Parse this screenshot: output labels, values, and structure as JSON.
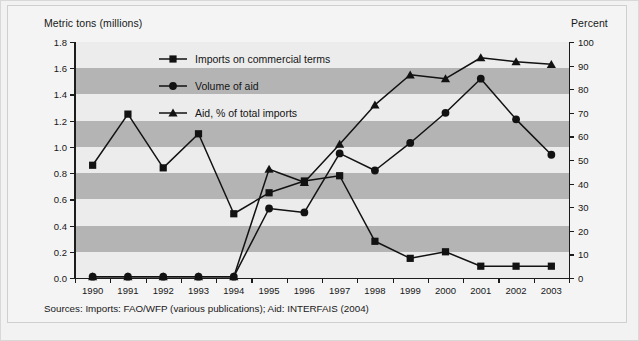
{
  "figure": {
    "y_axis_left_title": "Metric tons (millions)",
    "y_axis_right_title": "Percent",
    "source_note": "Sources: Imports: FAO/WFP (various publications); Aid: INTERFAIS (2004)"
  },
  "legend": {
    "items": [
      {
        "label": "Imports on commercial terms",
        "marker": "square-marker"
      },
      {
        "label": "Volume of aid",
        "marker": "circle-marker"
      },
      {
        "label": "Aid, % of total imports",
        "marker": "triangle-marker"
      }
    ]
  },
  "colors": {
    "band_dark": "#b4b4b4",
    "band_light": "#ececec",
    "ink": "#121212",
    "page_background": "#f2f2f2"
  },
  "chart_data": {
    "type": "line",
    "title": "",
    "subtitle": "",
    "xlabel": "",
    "ylabel": "Metric tons (millions)",
    "ylabel_secondary": "Percent",
    "grid": "horizontal alternating shaded bands",
    "legend_position": "inside upper-left",
    "x": [
      1990,
      1991,
      1992,
      1993,
      1994,
      1995,
      1996,
      1997,
      1998,
      1999,
      2000,
      2001,
      2002,
      2003
    ],
    "categories": [
      "1990",
      "1991",
      "1992",
      "1993",
      "1994",
      "1995",
      "1996",
      "1997",
      "1998",
      "1999",
      "2000",
      "2001",
      "2002",
      "2003"
    ],
    "ylim": [
      0.0,
      1.8
    ],
    "yticks": [
      "0.0",
      "0.2",
      "0.4",
      "0.6",
      "0.8",
      "1.0",
      "1.2",
      "1.4",
      "1.6",
      "1.8"
    ],
    "ylim_secondary": [
      0,
      100
    ],
    "yticks_secondary": [
      "0",
      "10",
      "20",
      "30",
      "40",
      "50",
      "60",
      "70",
      "80",
      "90",
      "100"
    ],
    "series": [
      {
        "name": "Imports on commercial terms",
        "axis": "left",
        "unit": "million metric tons",
        "marker": "square",
        "values": [
          0.86,
          1.25,
          0.84,
          1.1,
          0.49,
          0.65,
          0.74,
          0.78,
          0.28,
          0.15,
          0.2,
          0.09,
          0.09,
          0.09
        ]
      },
      {
        "name": "Volume of aid",
        "axis": "left",
        "unit": "million metric tons",
        "marker": "circle",
        "values": [
          0.01,
          0.01,
          0.01,
          0.01,
          0.01,
          0.53,
          0.5,
          0.95,
          0.82,
          1.03,
          1.26,
          1.52,
          1.21,
          0.94
        ]
      },
      {
        "name": "Aid, % of total imports",
        "axis": "right",
        "unit": "percent",
        "marker": "triangle",
        "values": [
          0.5,
          0.5,
          0.5,
          0.5,
          0.5,
          46.0,
          40.5,
          56.5,
          73.0,
          86.0,
          84.5,
          93.5,
          91.5,
          90.5
        ],
        "values_on_left_scale": [
          0.01,
          0.01,
          0.01,
          0.01,
          0.01,
          0.83,
          0.73,
          1.02,
          1.32,
          1.55,
          1.52,
          1.68,
          1.65,
          1.63
        ]
      }
    ]
  }
}
